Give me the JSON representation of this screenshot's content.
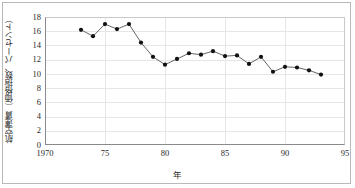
{
  "chart_data": {
    "type": "line",
    "title": "",
    "xlabel": "年",
    "ylabel": "航空運賃（価格指数、パーセント）",
    "xlim": [
      1970,
      1995
    ],
    "ylim": [
      0,
      18
    ],
    "xticks": [
      1970,
      1975,
      1980,
      1985,
      1990,
      1995
    ],
    "xtick_labels": [
      "1970",
      "75",
      "80",
      "85",
      "90",
      "95"
    ],
    "yticks": [
      0,
      2,
      4,
      6,
      8,
      10,
      12,
      14,
      16,
      18
    ],
    "ytick_labels": [
      "0",
      "2",
      "4",
      "6",
      "8",
      "10",
      "12",
      "14",
      "16",
      "18"
    ],
    "grid": true,
    "legend": "none",
    "marker": "filled-circle",
    "line_color": "#555555",
    "marker_color": "#111111",
    "x": [
      1973,
      1974,
      1975,
      1976,
      1977,
      1978,
      1979,
      1980,
      1981,
      1982,
      1983,
      1984,
      1985,
      1986,
      1987,
      1988,
      1989,
      1990,
      1991,
      1992,
      1993
    ],
    "values": [
      16.2,
      15.3,
      17.0,
      16.3,
      17.0,
      14.4,
      12.4,
      11.3,
      12.1,
      12.9,
      12.7,
      13.2,
      12.5,
      12.6,
      11.4,
      12.4,
      10.3,
      11.0,
      10.9,
      10.5,
      9.9
    ]
  },
  "axis": {
    "ylabel_text": "航空運賃（価格指数、パーセント）",
    "xlabel_text": "年"
  }
}
